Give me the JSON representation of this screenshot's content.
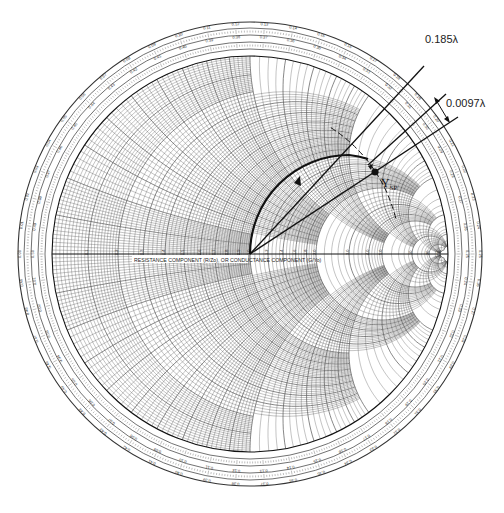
{
  "diagram": {
    "type": "smith-chart",
    "center": [
      250,
      254
    ],
    "radius": 198,
    "colors": {
      "grid": "#555555",
      "heavy": "#111111",
      "background": "#ffffff"
    },
    "axis_label": "RESISTANCE COMPONENT (R/Zo), OR CONDUCTANCE COMPONENT (G/Yo)",
    "upper_label": "INDUCTIVE REACTANCE COMPONENT (+jX/Zo), OR CAPACITIVE SUSCEPTANCE (+jB/Yo)",
    "lower_label": "CAPACITIVE REACTANCE COMPONENT (-jX/Zo), OR INDUCTIVE SUSCEPTANCE (-jB/Yo)",
    "outer_scale_labels": {
      "toward_generator": "WAVELENGTHS TOWARD GENERATOR",
      "toward_load": "WAVELENGTHS TOWARD LOAD",
      "reflection": "ANGLE OF REFLECTION COEFFICIENT IN DEGREES",
      "transmission": "ANGLE OF TRANSMISSION COEFFICIENT IN DEGREES"
    },
    "top_scale_values": [
      "0.11",
      "0.12",
      "0.13",
      "0.14",
      "0.15"
    ],
    "top_scale_values_inner": [
      "0.39",
      "0.38",
      "0.37",
      "0.36",
      "0.35"
    ],
    "top_angle_values": [
      "100",
      "90",
      "80",
      "70"
    ],
    "resistance_ticks": [
      "0.1",
      "0.2",
      "0.3",
      "0.4",
      "0.5",
      "0.6",
      "0.7",
      "0.8",
      "0.9",
      "1.0",
      "1.2",
      "1.4",
      "1.6",
      "1.8",
      "2.0",
      "3.0",
      "4.0",
      "5.0",
      "10",
      "20",
      "50"
    ],
    "annotations": {
      "line1_label": "0.185λ",
      "line2_label": "0.0097λ",
      "point_label": "Y",
      "point_subscript": "SP"
    }
  }
}
